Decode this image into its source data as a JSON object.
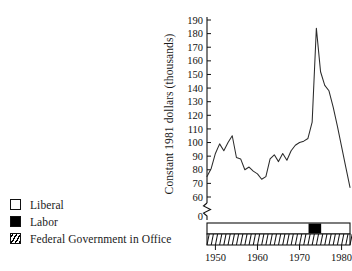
{
  "legend": {
    "items": [
      {
        "label": "Liberal",
        "swatch": "white-square-swatch"
      },
      {
        "label": "Labor",
        "swatch": "black-square-swatch"
      },
      {
        "label": "Federal Government in Office",
        "swatch": "hatched-square-swatch"
      }
    ]
  },
  "chart_data": {
    "type": "line",
    "title": "",
    "xlabel": "",
    "ylabel": "Constant 1981 dollars (thousands)",
    "ylim": [
      60,
      190
    ],
    "xlim": [
      1948,
      1982
    ],
    "grid": false,
    "legend_position": "left-outside",
    "y_axis_break": true,
    "y_break_label": "0",
    "ytick_labels": [
      "190",
      "180",
      "170",
      "160",
      "150",
      "140",
      "130",
      "120",
      "110",
      "100",
      "90",
      "80",
      "70",
      "60"
    ],
    "yticks": [
      190,
      180,
      170,
      160,
      150,
      140,
      130,
      120,
      110,
      100,
      90,
      80,
      70,
      60
    ],
    "xtick_labels": [
      "1950",
      "1960",
      "1970",
      "1980"
    ],
    "xticks": [
      1950,
      1960,
      1970,
      1980
    ],
    "series": [
      {
        "name": "Constant 1981 dollars (thousands)",
        "x": [
          1948,
          1949,
          1950,
          1951,
          1952,
          1953,
          1954,
          1955,
          1956,
          1957,
          1958,
          1959,
          1960,
          1961,
          1962,
          1963,
          1964,
          1965,
          1966,
          1967,
          1968,
          1969,
          1970,
          1971,
          1972,
          1973,
          1974,
          1975,
          1976,
          1977,
          1978,
          1979,
          1980,
          1981,
          1982
        ],
        "values": [
          75,
          81,
          92,
          99,
          94,
          100,
          105,
          89,
          88,
          80,
          82,
          79,
          77,
          73,
          75,
          88,
          91,
          86,
          92,
          87,
          94,
          98,
          100,
          101,
          103,
          115,
          184,
          152,
          142,
          138,
          126,
          112,
          97,
          82,
          67
        ]
      }
    ],
    "government_band": {
      "start_year": 1948,
      "end_year": 1982,
      "segments": [
        {
          "party": "Liberal",
          "start_year": 1948,
          "end_year": 1972,
          "fill": "white"
        },
        {
          "party": "Labor",
          "start_year": 1972,
          "end_year": 1975,
          "fill": "black"
        },
        {
          "party": "Liberal",
          "start_year": 1975,
          "end_year": 1982,
          "fill": "white"
        }
      ],
      "hatched_strip": true,
      "hatch_tick_count": 34
    },
    "colors": {
      "line": "#2b2b2b",
      "axis": "#111111",
      "liberal": "#ffffff",
      "labor": "#000000",
      "background": "#ffffff"
    }
  }
}
